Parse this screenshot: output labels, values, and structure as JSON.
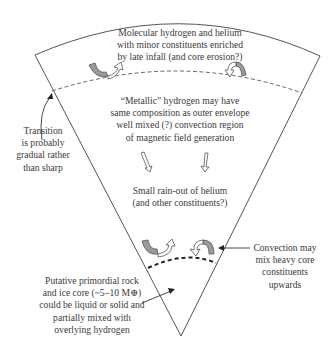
{
  "diagram": {
    "colors": {
      "line": "#555555",
      "dashed_boundary": "#555555",
      "core_boundary": "#222222",
      "convection_arrow_fill": "#9a9a9a",
      "text": "#3a3a3a"
    },
    "labels": {
      "outer_envelope": [
        "Molecular hydrogen and helium",
        "with minor constituents enriched",
        "by late infall (and core erosion?)"
      ],
      "metallic_region": [
        "“Metallic” hydrogen may have",
        "same composition as outer envelope",
        "well mixed (?) convection region",
        "of magnetic field generation"
      ],
      "helium_rainout": [
        "Small rain-out of helium",
        "(and other constituents?)"
      ],
      "transition_note": [
        "Transition",
        "is probably",
        "gradual rather",
        "than sharp"
      ],
      "core_convection_note": [
        "Convection may",
        "mix heavy core",
        "constituents",
        "upwards"
      ],
      "core_note": [
        "Putative primordial rock",
        "and ice core (~5–10 M⊕)",
        "could be liquid or solid and",
        "partially mixed with",
        "overlying hydrogen"
      ]
    },
    "icons": [
      "convection-arrow-upper-left",
      "convection-arrow-upper-right",
      "rainout-arrow-left",
      "rainout-arrow-right",
      "convection-arrow-lower-left",
      "convection-arrow-lower-right",
      "pointer-arrow-transition",
      "pointer-arrow-convection",
      "pointer-arrow-core"
    ]
  }
}
